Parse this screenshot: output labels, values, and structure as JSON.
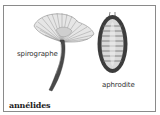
{
  "figure": {
    "title": "annélides",
    "specimens": [
      {
        "name": "spirographe"
      },
      {
        "name": "aphrodite"
      }
    ]
  }
}
